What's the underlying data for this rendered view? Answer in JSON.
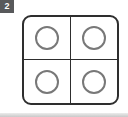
{
  "badge": {
    "label": "2"
  },
  "card": {
    "grid_rows": 2,
    "grid_cols": 2,
    "cell_shape": "circle"
  },
  "colors": {
    "canvas-bg": "#ffffff",
    "badge-bg": "#58595b",
    "badge-text": "#ffffff",
    "card-bg": "#ffffff",
    "card-border": "#2e2e2e",
    "divider": "#2e2e2e",
    "circle-stroke": "#787878",
    "bottombar": "#c9c9c9"
  }
}
